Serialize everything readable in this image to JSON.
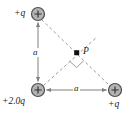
{
  "figure": {
    "colors": {
      "charge_fill": "#b3b3b3",
      "charge_stroke": "#4d4d4d",
      "line": "#808080",
      "dashed_line": "#999999",
      "text": "#1a1a1a",
      "background": "#ffffff"
    },
    "charges": [
      {
        "id": "top-left",
        "label": "+q",
        "sign": "+",
        "x": 38,
        "y": 14,
        "radius": 6.5
      },
      {
        "id": "bottom-left",
        "label": "+2.0q",
        "sign": "+",
        "x": 38,
        "y": 90,
        "radius": 6.5
      },
      {
        "id": "bottom-right",
        "label": "+q",
        "sign": "+",
        "x": 115,
        "y": 90,
        "radius": 6.5
      }
    ],
    "point": {
      "id": "P",
      "label": "P",
      "x": 77,
      "y": 53
    },
    "distances": [
      {
        "id": "vertical-side",
        "label": "a",
        "from": "top-left",
        "to": "bottom-left",
        "orientation": "vertical"
      },
      {
        "id": "horizontal-side",
        "label": "a",
        "from": "bottom-left",
        "to": "bottom-right",
        "orientation": "horizontal"
      }
    ],
    "annotations": {
      "right_angle_marker": "right-angle at P between hypotenuse and line from +2.0q"
    }
  }
}
